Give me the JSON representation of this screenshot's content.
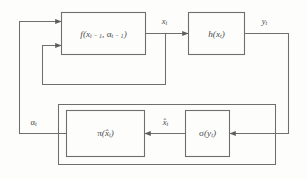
{
  "diagram": {
    "background_color": "#fdfdfc",
    "line_color": "#6f6f70",
    "text_color": "#4a4a4b",
    "blocks": [
      {
        "id": "state-transition",
        "label": "f(x_{t-1}, α_{t-1})",
        "label_main": "f",
        "label_open": "(",
        "arg1_base": "x",
        "arg1_sub": "t − 1",
        "comma": ", ",
        "arg2_base": "α",
        "arg2_sub": "t − 1",
        "label_close": ")"
      },
      {
        "id": "observation",
        "label": "h(x_t)",
        "label_main": "h",
        "label_open": "(",
        "arg1_base": "x",
        "arg1_sub": "t",
        "label_close": ")"
      },
      {
        "id": "policy",
        "label": "π(x̂_t)",
        "label_main": "π",
        "label_open": "(",
        "arg1_base": "x̂",
        "arg1_sub": "t",
        "label_close": ")"
      },
      {
        "id": "estimator",
        "label": "σ(y_t)",
        "label_main": "σ",
        "label_open": "(",
        "arg1_base": "y",
        "arg1_sub": "t",
        "label_close": ")"
      }
    ],
    "signals": [
      {
        "id": "state",
        "label": "x_t",
        "base": "x",
        "sub": "t"
      },
      {
        "id": "measurement",
        "label": "y_t",
        "base": "y",
        "sub": "t"
      },
      {
        "id": "estimate",
        "label": "x̂_t",
        "base": "x̂",
        "sub": "t"
      },
      {
        "id": "action",
        "label": "α_t",
        "base": "α",
        "sub": "t"
      }
    ]
  }
}
